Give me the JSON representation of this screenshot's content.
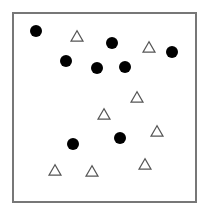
{
  "frame": {
    "x": 13,
    "y": 13,
    "width": 183,
    "height": 189,
    "stroke": "#777777",
    "stroke_width": 2
  },
  "colors": {
    "circle_fill": "#000000",
    "triangle_stroke": "#555555",
    "triangle_fill": "#ffffff"
  },
  "circles": [
    {
      "cx": 36,
      "cy": 31,
      "r": 6
    },
    {
      "cx": 112,
      "cy": 43,
      "r": 6
    },
    {
      "cx": 172,
      "cy": 52,
      "r": 6
    },
    {
      "cx": 66,
      "cy": 61,
      "r": 6
    },
    {
      "cx": 97,
      "cy": 68,
      "r": 6
    },
    {
      "cx": 125,
      "cy": 67,
      "r": 6
    },
    {
      "cx": 120,
      "cy": 138,
      "r": 6
    },
    {
      "cx": 73,
      "cy": 144,
      "r": 6
    }
  ],
  "triangles": [
    {
      "cx": 77,
      "cy": 36,
      "size": 12
    },
    {
      "cx": 149,
      "cy": 47,
      "size": 12
    },
    {
      "cx": 137,
      "cy": 97,
      "size": 12
    },
    {
      "cx": 104,
      "cy": 114,
      "size": 12
    },
    {
      "cx": 157,
      "cy": 131,
      "size": 12
    },
    {
      "cx": 145,
      "cy": 164,
      "size": 12
    },
    {
      "cx": 55,
      "cy": 170,
      "size": 12
    },
    {
      "cx": 92,
      "cy": 171,
      "size": 12
    }
  ]
}
